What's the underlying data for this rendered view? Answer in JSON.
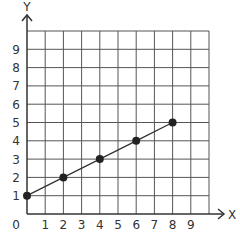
{
  "chart_data": {
    "type": "line",
    "title": "",
    "xlabel": "X",
    "ylabel": "Y",
    "xlim": [
      0,
      10
    ],
    "ylim": [
      0,
      10
    ],
    "grid": true,
    "x_ticks": [
      "0",
      "1",
      "2",
      "3",
      "4",
      "5",
      "6",
      "7",
      "8",
      "9"
    ],
    "y_ticks": [
      "1",
      "2",
      "3",
      "4",
      "5",
      "6",
      "7",
      "8",
      "9"
    ],
    "series": [
      {
        "name": "line",
        "x": [
          0,
          2,
          4,
          6,
          8
        ],
        "y": [
          1,
          2,
          3,
          4,
          5
        ],
        "markers": true
      }
    ]
  },
  "colors": {
    "grid": "#555555",
    "axis": "#333333",
    "line": "#333333",
    "marker": "#222222"
  },
  "axes": {
    "x_label": "X",
    "y_label": "Y",
    "origin_label": "0"
  }
}
